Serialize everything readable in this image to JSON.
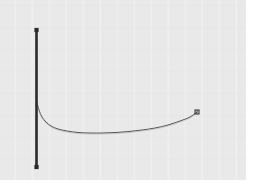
{
  "figure": {
    "title": "",
    "background_color": "#e9e9e9",
    "page_color": "#ffffff",
    "width": 253,
    "height": 196
  },
  "axis": {
    "name": "vertical-axis-line",
    "color": "#2b2b2b",
    "thickness": 2.6,
    "x": 36.5,
    "y_top": 30,
    "y_bottom": 167,
    "cap_marker": "square",
    "cap_marker_size": 4.2
  },
  "curve": {
    "name": "decaying-rising-curve",
    "color": "#555555",
    "thickness": 1.0,
    "end_marker": "square",
    "end_marker_size": 4.0,
    "end_marker_color": "#3a3a3a"
  },
  "chart_data": {
    "type": "line",
    "title": "",
    "xlabel": "",
    "ylabel": "",
    "grid": false,
    "legend": null,
    "xlim": [
      36,
      200
    ],
    "ylim": [
      167,
      30
    ],
    "axis_line": {
      "x": 36.5,
      "y_range": [
        30,
        167
      ],
      "markers": [
        {
          "x": 36.5,
          "y": 30
        },
        {
          "x": 36.5,
          "y": 167
        }
      ]
    },
    "series": [
      {
        "name": "curve",
        "x": [
          37,
          39,
          42,
          46,
          51,
          58,
          67,
          78,
          90,
          103,
          116,
          129,
          142,
          155,
          168,
          180,
          190,
          197
        ],
        "y": [
          103,
          110,
          117,
          122,
          126,
          129,
          131,
          132.5,
          133,
          133,
          132.5,
          131.5,
          130,
          128,
          125,
          121,
          117,
          112
        ]
      }
    ],
    "annotations": [
      {
        "type": "marker",
        "shape": "square",
        "x": 197,
        "y": 112
      }
    ]
  }
}
